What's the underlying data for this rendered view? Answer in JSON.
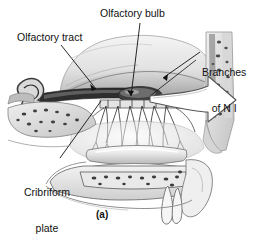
{
  "figure": {
    "panel_label": "(a)",
    "background_color": "#ffffff",
    "ink_color": "#111111",
    "style": "grayscale-medical-illustration"
  },
  "labels": {
    "olfactory_tract": "Olfactory tract",
    "olfactory_bulb": "Olfactory bulb",
    "branches_of_n1_line1": "Branches",
    "branches_of_n1_line2": "of N I",
    "cribriform_line1": "Cribriform",
    "cribriform_line2": "plate"
  },
  "annotations": {
    "callout_arrow": "large-hollow-arrow-pointing-right",
    "leader_lines": 4
  },
  "palette": {
    "tissue_light": "#ededed",
    "tissue_mid": "#c9c9c9",
    "tissue_dark": "#8f8f8f",
    "bone_shadow": "#6e6e6e",
    "outline": "#2b2b2b",
    "brain_gray": "#dcdcdc",
    "cavity_dark": "#3a3a3a"
  }
}
